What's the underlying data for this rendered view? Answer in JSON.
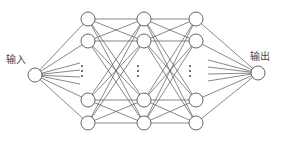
{
  "diagram": {
    "type": "neural-network",
    "labels": {
      "input": "输入",
      "output": "输出"
    },
    "ellipsis": "⋮",
    "layers": [
      {
        "name": "input",
        "x": 35,
        "nodes": [
          75
        ]
      },
      {
        "name": "hidden-1",
        "x": 88,
        "nodes": [
          19,
          41,
          100,
          123
        ]
      },
      {
        "name": "hidden-2",
        "x": 144,
        "nodes": [
          19,
          41,
          100,
          123
        ]
      },
      {
        "name": "hidden-3",
        "x": 196,
        "nodes": [
          19,
          41,
          100,
          123
        ]
      },
      {
        "name": "output",
        "x": 258,
        "nodes": [
          73
        ]
      }
    ],
    "node_radius": 7,
    "colors": {
      "stroke": "#555555",
      "fill": "#ffffff",
      "text": "#444444"
    }
  }
}
